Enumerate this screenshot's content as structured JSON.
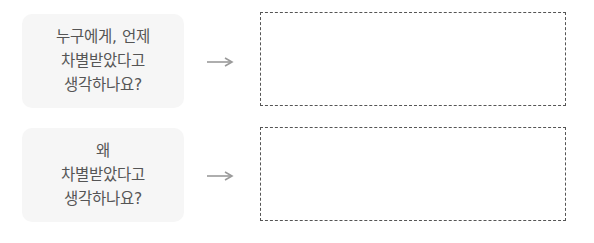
{
  "rows": [
    {
      "question_lines": [
        "누구에게, 언제",
        "차별받았다고",
        "생각하나요?"
      ],
      "arrow_icon": "right-arrow-icon",
      "answer": ""
    },
    {
      "question_lines": [
        "왜",
        "차별받았다고",
        "생각하나요?"
      ],
      "arrow_icon": "right-arrow-icon",
      "answer": ""
    }
  ],
  "colors": {
    "question_bg": "#f6f6f6",
    "text": "#555555",
    "arrow": "#9a9a9a",
    "dashed_border": "#555555"
  }
}
